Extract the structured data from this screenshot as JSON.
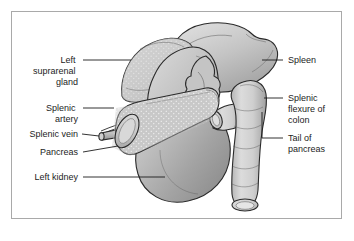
{
  "figure": {
    "border_color": "#a9a9a9",
    "background_color": "#ffffff",
    "line_color": "#1c1c1c"
  },
  "labels": {
    "left": [
      {
        "id": "left-suprarenal-gland",
        "name": "left-suprarenal-gland-label",
        "lines": [
          "Left",
          "suprarenal",
          "gland"
        ],
        "line1": "Left",
        "line2": "suprarenal",
        "line3": "gland",
        "text_x": 78,
        "text_y": 63,
        "leader": "M 83 60 L 131 60"
      },
      {
        "id": "splenic-artery",
        "name": "splenic-artery-label",
        "lines": [
          "Splenic",
          "artery"
        ],
        "line1": "Splenic",
        "line2": "artery",
        "text_x": 78,
        "text_y": 111,
        "leader": "M 83 108 L 113 108"
      },
      {
        "id": "splenic-vein",
        "name": "splenic-vein-label",
        "lines": [
          "Splenic vein"
        ],
        "line1": "Splenic vein",
        "text_x": 78,
        "text_y": 137,
        "leader": "M 82 134 L 101 134"
      },
      {
        "id": "pancreas",
        "name": "pancreas-label",
        "lines": [
          "Pancreas"
        ],
        "line1": "Pancreas",
        "text_x": 78,
        "text_y": 155,
        "leader": "M 83 152 L 112 147"
      },
      {
        "id": "left-kidney",
        "name": "left-kidney-label",
        "lines": [
          "Left kidney"
        ],
        "line1": "Left kidney",
        "text_x": 78,
        "text_y": 180,
        "leader": "M 83 177 L 163 177"
      }
    ],
    "right": [
      {
        "id": "spleen",
        "name": "spleen-label",
        "lines": [
          "Spleen"
        ],
        "line1": "Spleen",
        "text_x": 288,
        "text_y": 63,
        "leader": "M 262 60 L 283 60"
      },
      {
        "id": "splenic-flexure-of-colon",
        "name": "splenic-flexure-of-colon-label",
        "lines": [
          "Splenic",
          "flexure of",
          "colon"
        ],
        "line1": "Splenic",
        "line2": "flexure of",
        "line3": "colon",
        "text_x": 288,
        "text_y": 101,
        "leader": "M 262 98 L 283 98"
      },
      {
        "id": "tail-of-pancreas",
        "name": "tail-of-pancreas-label",
        "lines": [
          "Tail of",
          "pancreas"
        ],
        "line1": "Tail of",
        "line2": "pancreas",
        "text_x": 288,
        "text_y": 141,
        "leader": "M 262 138 L 283 138"
      }
    ]
  },
  "organs": {
    "suprarenal_gland": {
      "name": "suprarenal-gland-shape",
      "fill": "#cfcfcf"
    },
    "spleen": {
      "name": "spleen-shape",
      "fill": "#c8c8c8"
    },
    "kidney": {
      "name": "kidney-shape",
      "fill": "#b8b8b8"
    },
    "pancreas": {
      "name": "pancreas-shape",
      "fill": "#d2d2d2"
    },
    "colon": {
      "name": "colon-shape",
      "fill": "#cdcdcd"
    },
    "splenic_artery": {
      "name": "splenic-artery-vessel",
      "fill": "#bcbcbc"
    },
    "splenic_vein": {
      "name": "splenic-vein-vessel",
      "fill": "#b4b4b4"
    },
    "transverse_colon_stump": {
      "name": "transverse-colon-stump-shape",
      "fill": "#cdcdcd"
    }
  }
}
